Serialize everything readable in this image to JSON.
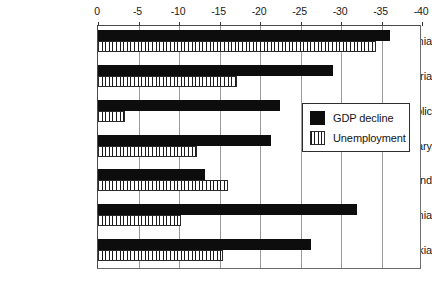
{
  "chart_data": {
    "type": "bar",
    "orientation": "horizontal",
    "title": "",
    "subtitle": "",
    "xlabel": "",
    "ylabel": "",
    "xlim": [
      0,
      -40
    ],
    "axis_position": "top",
    "grid": true,
    "legend_position": "middle-right",
    "categories": [
      "Albania",
      "Bulgaria",
      "Czech Republic",
      "Hungary",
      "Poland",
      "Romania",
      "Slovakia"
    ],
    "tick_labels": [
      "0",
      "-5",
      "-10",
      "-15",
      "-20",
      "-25",
      "-30",
      "-35",
      "-40"
    ],
    "tick_values": [
      0,
      -5,
      -10,
      -15,
      -20,
      -25,
      -30,
      -35,
      -40
    ],
    "series": [
      {
        "name": "GDP decline",
        "fill": "solid-black",
        "color": "#0d0d0d",
        "values": [
          -36.0,
          -29.0,
          -22.5,
          -21.3,
          -13.2,
          -32.0,
          -26.3
        ]
      },
      {
        "name": "Unemployment",
        "fill": "vertical-hatch",
        "color": "#1a1a1a",
        "values": [
          -34.3,
          -17.2,
          -3.3,
          -12.2,
          -16.0,
          -10.2,
          -15.4
        ]
      }
    ]
  },
  "legend": {
    "items": [
      {
        "label": "GDP decline",
        "swatch": "solid-black"
      },
      {
        "label": "Unemployment",
        "swatch": "vertical-hatch"
      }
    ]
  }
}
